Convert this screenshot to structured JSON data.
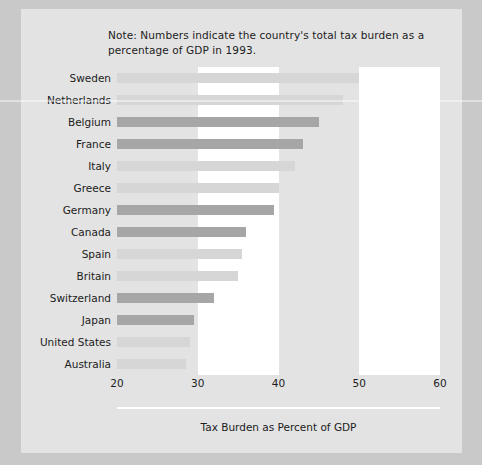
{
  "note": {
    "text": "Note: Numbers indicate the country's total tax burden as a percentage of GDP in 1993."
  },
  "colors": {
    "figure_background": "#e3e3e3",
    "page_background": "#c9c9c9",
    "band_white": "#ffffff",
    "bar_dark": "#a6a6a6",
    "bar_light": "#d6d6d6",
    "text": "#1c1c1c"
  },
  "chart_data": {
    "type": "bar",
    "orientation": "horizontal",
    "title": "",
    "xlabel": "Tax Burden as Percent of GDP",
    "ylabel": "",
    "xlim": [
      20,
      60
    ],
    "xticks": [
      20,
      30,
      40,
      50,
      60
    ],
    "xtick_labels": [
      "20",
      "30",
      "40",
      "50",
      "60"
    ],
    "grid": "vertical white bands between 30-40 and 50-60",
    "legend": "none",
    "baseline": 20,
    "note": "Note: Numbers indicate the country's total tax burden as a percentage of GDP in 1993.",
    "categories": [
      "Sweden",
      "Netherlands",
      "Belgium",
      "France",
      "Italy",
      "Greece",
      "Germany",
      "Canada",
      "Spain",
      "Britain",
      "Switzerland",
      "Japan",
      "United States",
      "Australia"
    ],
    "values": [
      50,
      48,
      45,
      43,
      42,
      40,
      39.5,
      36,
      35.5,
      35,
      32,
      29.5,
      29,
      28.5
    ],
    "bar_shades": [
      "light",
      "light",
      "dark",
      "dark",
      "light",
      "light",
      "dark",
      "dark",
      "light",
      "light",
      "dark",
      "dark",
      "light",
      "light"
    ]
  }
}
